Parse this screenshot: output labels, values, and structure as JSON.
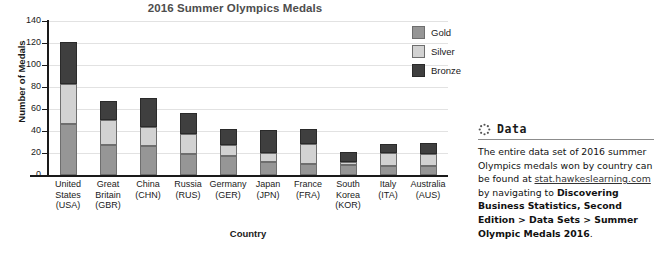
{
  "chart_data": {
    "type": "bar",
    "subtype": "stacked",
    "title": "2016 Summer Olympics Medals",
    "xlabel": "Country",
    "ylabel": "Number of Medals",
    "ylim": [
      0,
      140
    ],
    "yticks": [
      0,
      20,
      40,
      60,
      80,
      100,
      120,
      140
    ],
    "grid": true,
    "legend_position": "top-right",
    "categories": [
      "United States (USA)",
      "Great Britain (GBR)",
      "China (CHN)",
      "Russia (RUS)",
      "Germany (GER)",
      "Japan (JPN)",
      "France (FRA)",
      "South Korea (KOR)",
      "Italy (ITA)",
      "Australia (AUS)"
    ],
    "category_lines": [
      [
        "United",
        "States",
        "(USA)"
      ],
      [
        "Great",
        "Britain",
        "(GBR)"
      ],
      [
        "China",
        "(CHN)"
      ],
      [
        "Russia",
        "(RUS)"
      ],
      [
        "Germany",
        "(GER)"
      ],
      [
        "Japan",
        "(JPN)"
      ],
      [
        "France",
        "(FRA)"
      ],
      [
        "South",
        "Korea",
        "(KOR)"
      ],
      [
        "Italy",
        "(ITA)"
      ],
      [
        "Australia",
        "(AUS)"
      ]
    ],
    "series": [
      {
        "name": "Gold",
        "color": "#969696",
        "values": [
          46,
          27,
          26,
          19,
          17,
          12,
          10,
          9,
          8,
          8
        ]
      },
      {
        "name": "Silver",
        "color": "#d2d2d2",
        "values": [
          37,
          23,
          18,
          18,
          10,
          8,
          18,
          3,
          12,
          11
        ]
      },
      {
        "name": "Bronze",
        "color": "#3f3f3f",
        "values": [
          38,
          17,
          26,
          19,
          15,
          21,
          14,
          9,
          8,
          10
        ]
      }
    ],
    "totals": [
      121,
      67,
      70,
      56,
      42,
      41,
      42,
      21,
      28,
      29
    ]
  },
  "legend": {
    "items": [
      {
        "label": "Gold",
        "color": "#969696"
      },
      {
        "label": "Silver",
        "color": "#d2d2d2"
      },
      {
        "label": "Bronze",
        "color": "#3f3f3f"
      }
    ]
  },
  "data_panel": {
    "icon": "dotted-circle-icon",
    "heading": "Data",
    "text_part_1": "The entire data set of 2016 summer Olympics medals won by country can be found at ",
    "link": "stat.hawkeslearning.com",
    "text_part_2": " by navigating to ",
    "bold_path": "Discovering Business Statistics, Second Edition > Data Sets > Summer Olympic Medals 2016",
    "text_part_3": "."
  }
}
